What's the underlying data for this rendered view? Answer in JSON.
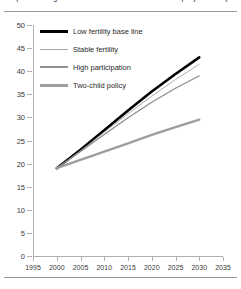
{
  "figure": {
    "title": "Population aged 65 and over under alternative projections (millions)"
  },
  "chart_data": {
    "type": "line",
    "title": "Population aged 65 and over under alternative projections (millions)",
    "xlabel": "",
    "ylabel": "",
    "xlim": [
      1995,
      2035
    ],
    "ylim": [
      0,
      50
    ],
    "xticks": [
      1995,
      2000,
      2005,
      2010,
      2015,
      2020,
      2025,
      2030,
      2035
    ],
    "yticks": [
      0,
      5,
      10,
      15,
      20,
      25,
      30,
      35,
      40,
      45,
      50
    ],
    "grid": false,
    "legend_position": "upper-left",
    "x": [
      2000,
      2005,
      2010,
      2015,
      2020,
      2025,
      2030
    ],
    "series": [
      {
        "name": "Low fertility base line",
        "color": "#000000",
        "width": 2.6,
        "values": [
          19.0,
          23.0,
          27.2,
          31.5,
          35.6,
          39.4,
          43.0
        ]
      },
      {
        "name": "Stable fertility",
        "color": "#9a9a9a",
        "width": 0.8,
        "values": [
          19.0,
          22.8,
          26.8,
          30.8,
          34.6,
          38.2,
          41.5
        ]
      },
      {
        "name": "High participation",
        "color": "#8c8c8c",
        "width": 1.2,
        "values": [
          19.0,
          22.6,
          26.3,
          29.9,
          33.3,
          36.3,
          39.0
        ]
      },
      {
        "name": "Two-child policy",
        "color": "#9e9e9e",
        "width": 2.4,
        "values": [
          19.0,
          20.8,
          22.6,
          24.4,
          26.2,
          27.9,
          29.5
        ]
      }
    ]
  },
  "legend": {
    "items": [
      {
        "label": "Low fertility base line",
        "color": "#000000",
        "thickness": "3px"
      },
      {
        "label": "Stable fertility",
        "color": "#a8a8a8",
        "thickness": "1px"
      },
      {
        "label": "High participation",
        "color": "#8f8f8f",
        "thickness": "1.5px"
      },
      {
        "label": "Two-child policy",
        "color": "#9e9e9e",
        "thickness": "3px"
      }
    ]
  }
}
